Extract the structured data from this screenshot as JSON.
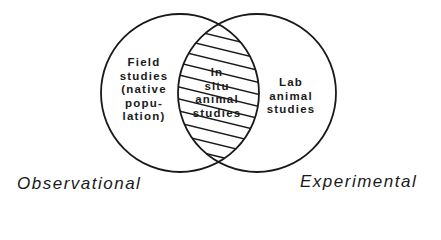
{
  "diagram": {
    "type": "venn",
    "sets": [
      {
        "name": "Observational",
        "region_label": [
          "Field",
          "studies",
          "(native",
          "popu-",
          "lation)"
        ]
      },
      {
        "name": "Experimental",
        "region_label": [
          "Lab",
          "animal",
          "studies"
        ]
      }
    ],
    "intersection": {
      "label": [
        "In",
        "situ",
        "animal",
        "studies"
      ],
      "fill": "hatched"
    },
    "colors": {
      "stroke": "#1a1a1a",
      "background": "#ffffff"
    }
  },
  "labels": {
    "left_caption": "Observational",
    "right_caption": "Experimental",
    "left_region": {
      "l0": "Field",
      "l1": "studies",
      "l2": "(native",
      "l3": "popu-",
      "l4": "lation)"
    },
    "right_region": {
      "l0": "Lab",
      "l1": "animal",
      "l2": "studies"
    },
    "intersection": {
      "l0": "In",
      "l1": "situ",
      "l2": "animal",
      "l3": "studies"
    }
  }
}
